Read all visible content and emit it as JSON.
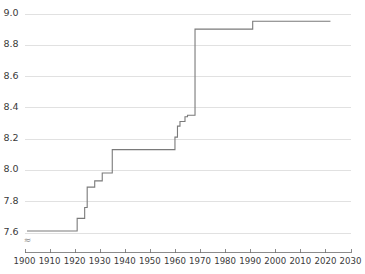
{
  "chart_data": {
    "type": "line",
    "title": "",
    "subtitle": "",
    "xlabel": "",
    "ylabel": "",
    "xlim": [
      1900,
      2030
    ],
    "ylim": [
      7.6,
      9.0
    ],
    "grid": "horizontal",
    "legend": "none",
    "axis_break": "≈",
    "axis_break_note": "y-axis broken below 7.6",
    "line_color": "#7a7a7a",
    "grid_color": "#d9d9d9",
    "axis_color": "#6e6e6e",
    "background_color": "#ffffff",
    "interpolation": "step-after",
    "x_ticks": [
      1900,
      1910,
      1920,
      1930,
      1940,
      1950,
      1960,
      1970,
      1980,
      1990,
      2000,
      2010,
      2020,
      2030
    ],
    "x_tick_labels": [
      "1900",
      "1910",
      "1920",
      "1930",
      "1940",
      "1950",
      "1960",
      "1970",
      "1980",
      "1990",
      "2000",
      "2010",
      "2020",
      "2030"
    ],
    "y_ticks": [
      7.6,
      7.8,
      8.0,
      8.2,
      8.4,
      8.6,
      8.8,
      9.0
    ],
    "y_tick_labels": [
      "7.6",
      "7.8",
      "8.0",
      "8.2",
      "8.4",
      "8.6",
      "8.8",
      "9.0"
    ],
    "x": [
      1901,
      1921,
      1924,
      1925,
      1928,
      1931,
      1935,
      1960,
      1961,
      1962,
      1964,
      1965,
      1967,
      1968,
      1991,
      2022
    ],
    "values": [
      7.61,
      7.69,
      7.76,
      7.89,
      7.93,
      7.98,
      8.13,
      8.13,
      8.21,
      8.28,
      8.31,
      8.34,
      8.35,
      8.9,
      8.95,
      8.95
    ],
    "points": [
      {
        "x": 1901,
        "y": 7.61
      },
      {
        "x": 1921,
        "y": 7.69
      },
      {
        "x": 1924,
        "y": 7.76
      },
      {
        "x": 1925,
        "y": 7.89
      },
      {
        "x": 1928,
        "y": 7.93
      },
      {
        "x": 1931,
        "y": 7.98
      },
      {
        "x": 1935,
        "y": 8.13
      },
      {
        "x": 1960,
        "y": 8.21
      },
      {
        "x": 1961,
        "y": 8.28
      },
      {
        "x": 1962,
        "y": 8.31
      },
      {
        "x": 1964,
        "y": 8.34
      },
      {
        "x": 1965,
        "y": 8.35
      },
      {
        "x": 1968,
        "y": 8.9
      },
      {
        "x": 1991,
        "y": 8.95
      },
      {
        "x": 2022,
        "y": 8.95
      }
    ]
  }
}
